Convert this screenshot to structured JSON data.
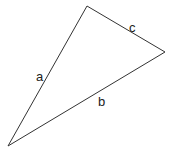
{
  "diagram": {
    "type": "triangle",
    "vertices": {
      "top": [
        87,
        6
      ],
      "right": [
        165,
        52
      ],
      "bottom_left": [
        8,
        146
      ]
    },
    "sides": [
      {
        "name": "a",
        "label": "a",
        "from": "bottom_left",
        "to": "top",
        "label_pos": [
          36,
          81
        ]
      },
      {
        "name": "b",
        "label": "b",
        "from": "bottom_left",
        "to": "right",
        "label_pos": [
          98,
          106
        ]
      },
      {
        "name": "c",
        "label": "c",
        "from": "top",
        "to": "right",
        "label_pos": [
          129,
          32
        ]
      }
    ],
    "stroke_color": "#333333",
    "background": "#ffffff"
  }
}
